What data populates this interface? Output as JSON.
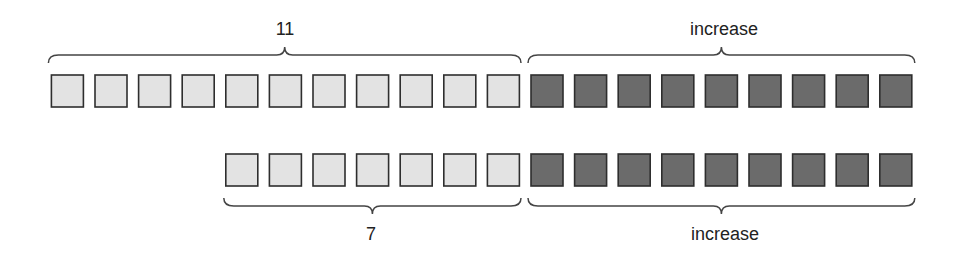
{
  "diagram": {
    "colors": {
      "light_fill": "#e3e3e3",
      "dark_fill": "#6b6b6b",
      "border": "#2e2e2e",
      "bracket": "#444444"
    },
    "row1": {
      "light_count": 11,
      "dark_count": 9,
      "top_labels": {
        "light": "11",
        "dark": "increase"
      }
    },
    "row2": {
      "light_count": 7,
      "dark_count": 9,
      "bottom_labels": {
        "light": "7",
        "dark": "increase"
      }
    }
  }
}
